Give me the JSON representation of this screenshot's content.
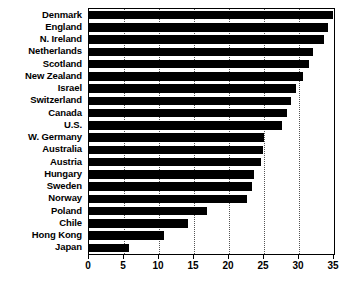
{
  "chart_data": {
    "type": "bar",
    "orientation": "horizontal",
    "title": "",
    "subtitle": "",
    "xlabel": "",
    "ylabel": "",
    "xlim": [
      0,
      35
    ],
    "xticks": [
      0,
      5,
      10,
      15,
      20,
      25,
      30,
      35
    ],
    "xtick_labels": [
      "0",
      "5",
      "10",
      "15",
      "20",
      "25",
      "30",
      "35"
    ],
    "grid": "vertical-dotted",
    "legend": null,
    "bar_color": "#000000",
    "background_color": "#ffffff",
    "axis_color": "#000000",
    "gridline_color": "#555555",
    "categories": [
      "Denmark",
      "England",
      "N. Ireland",
      "Netherlands",
      "Scotland",
      "New Zealand",
      "Israel",
      "Switzerland",
      "Canada",
      "U.S.",
      "W. Germany",
      "Australia",
      "Austria",
      "Hungary",
      "Sweden",
      "Norway",
      "Poland",
      "Chile",
      "Hong Kong",
      "Japan"
    ],
    "values": [
      34.8,
      34.2,
      33.5,
      32.0,
      31.4,
      30.5,
      29.5,
      28.8,
      28.3,
      27.5,
      25.0,
      24.8,
      24.5,
      23.5,
      23.3,
      22.5,
      16.8,
      14.2,
      10.7,
      5.7
    ]
  }
}
